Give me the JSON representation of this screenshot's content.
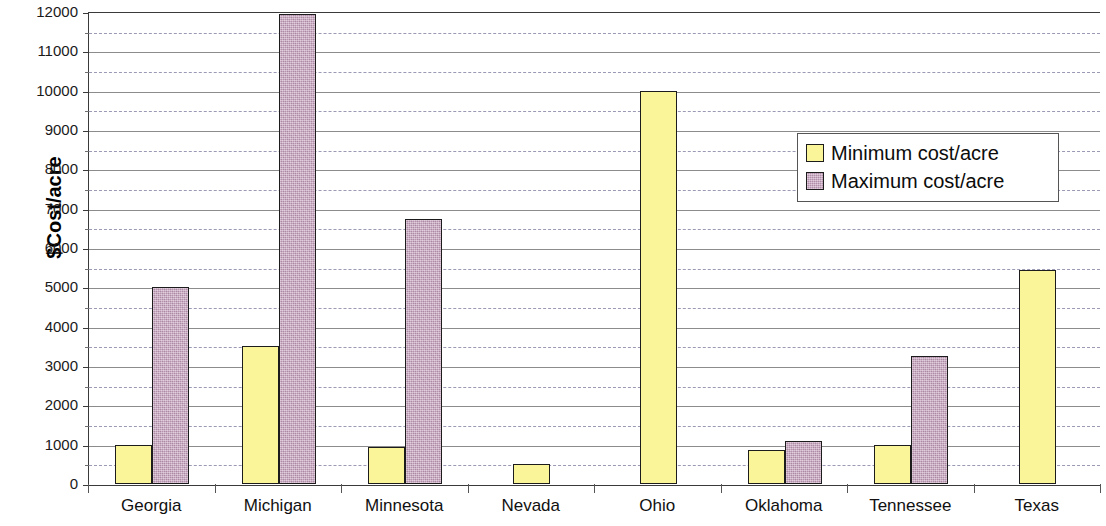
{
  "chart_data": {
    "type": "bar",
    "title": "",
    "xlabel": "",
    "ylabel": "$Cost/acre",
    "ylim": [
      0,
      12000
    ],
    "ytick_step": 1000,
    "minor_gridline_step": 500,
    "grid": true,
    "legend_position": "inside-right-upper",
    "categories": [
      "Georgia",
      "Michigan",
      "Minnesota",
      "Nevada",
      "Ohio",
      "Oklahoma",
      "Tennessee",
      "Texas"
    ],
    "series": [
      {
        "name": "Minimum cost/acre",
        "color": "#fbf59a",
        "values": [
          1000,
          3500,
          950,
          500,
          10000,
          870,
          1000,
          5450
        ]
      },
      {
        "name": "Maximum cost/acre",
        "color": "#c49cbb",
        "values": [
          5000,
          11950,
          6750,
          null,
          null,
          1100,
          3250,
          null
        ]
      }
    ],
    "ytick_labels": [
      "0",
      "1000",
      "2000",
      "3000",
      "4000",
      "5000",
      "6000",
      "7000",
      "8000",
      "9000",
      "10000",
      "11000",
      "12000"
    ]
  },
  "legend": {
    "items": [
      {
        "label": "Minimum cost/acre",
        "swatch": "min"
      },
      {
        "label": "Maximum cost/acre",
        "swatch": "max"
      }
    ]
  }
}
